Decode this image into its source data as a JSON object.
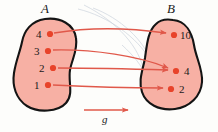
{
  "diagram": {
    "type": "function-mapping-diagram",
    "map_label": "g",
    "colors": {
      "blob_fill": "#f7b0a4",
      "blob_stroke": "#141414",
      "dot": "#e8432a",
      "arrow": "#e0584a",
      "ghost_curve": "#b9c3cf",
      "text": "#1a1a1a",
      "background": "#fdfdfb"
    },
    "sets": {
      "domain": {
        "name": "A",
        "elements": [
          {
            "value": "4",
            "cx": 50,
            "cy": 34,
            "label_x": 36,
            "label_y": 29
          },
          {
            "value": "3",
            "cx": 48,
            "cy": 51,
            "label_x": 34,
            "label_y": 46
          },
          {
            "value": "2",
            "cx": 53,
            "cy": 68,
            "label_x": 39,
            "label_y": 63
          },
          {
            "value": "1",
            "cx": 48,
            "cy": 85,
            "label_x": 34,
            "label_y": 80
          }
        ]
      },
      "codomain": {
        "name": "B",
        "elements": [
          {
            "value": "10",
            "cx": 174,
            "cy": 35,
            "label_x": 180,
            "label_y": 30
          },
          {
            "value": "4",
            "cx": 176,
            "cy": 71,
            "label_x": 184,
            "label_y": 66
          },
          {
            "value": "2",
            "cx": 171,
            "cy": 89,
            "label_x": 179,
            "label_y": 84
          }
        ]
      }
    },
    "mappings": [
      {
        "from": "4",
        "to": "10"
      },
      {
        "from": "3",
        "to": "4"
      },
      {
        "from": "2",
        "to": "4"
      },
      {
        "from": "1",
        "to": "2"
      }
    ]
  }
}
